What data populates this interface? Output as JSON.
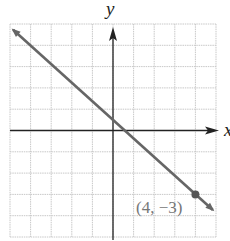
{
  "chart_data": {
    "type": "line",
    "title": "",
    "xlabel": "x",
    "ylabel": "y",
    "xlim": [
      -5,
      5
    ],
    "ylim": [
      -5,
      5
    ],
    "grid": true,
    "grid_step": 1,
    "series": [
      {
        "name": "line",
        "x": [
          -4.85,
          4.85
        ],
        "y": [
          4.73,
          -3.73
        ],
        "slope": -0.857,
        "y_intercept": 0.43,
        "arrows": "both",
        "color": "#666666"
      }
    ],
    "points": [
      {
        "x": 4,
        "y": -3,
        "label": "(4, −3)"
      }
    ],
    "annotations": [
      "(4, −3)"
    ]
  },
  "labels": {
    "x_axis": "x",
    "y_axis": "y",
    "point": "(4, −3)"
  },
  "colors": {
    "grid": "#c8c8c8",
    "axes": "#222222",
    "line": "#666666",
    "point": "#555555",
    "label": "#777777"
  }
}
